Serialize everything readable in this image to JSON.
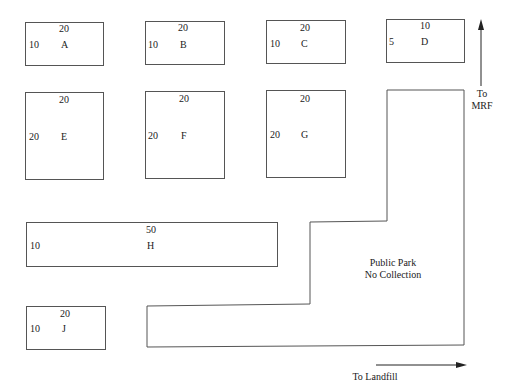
{
  "blocks": {
    "A": {
      "name": "A",
      "top_label": "20",
      "side_label": "10"
    },
    "B": {
      "name": "B",
      "top_label": "20",
      "side_label": "10"
    },
    "C": {
      "name": "C",
      "top_label": "20",
      "side_label": "10"
    },
    "D": {
      "name": "D",
      "top_label": "10",
      "side_label": "5"
    },
    "E": {
      "name": "E",
      "top_label": "20",
      "side_label": "20"
    },
    "F": {
      "name": "F",
      "top_label": "20",
      "side_label": "20"
    },
    "G": {
      "name": "G",
      "top_label": "20",
      "side_label": "20"
    },
    "H": {
      "name": "H",
      "top_label": "50",
      "side_label": "10"
    },
    "J": {
      "name": "J",
      "top_label": "20",
      "side_label": "10"
    }
  },
  "park": {
    "line1": "Public Park",
    "line2": "No Collection"
  },
  "directions": {
    "mrf_line1": "To",
    "mrf_line2": "MRF",
    "landfill": "To Landfill"
  },
  "colors": {
    "line": "#555555",
    "text": "#222222",
    "background": "#ffffff"
  }
}
